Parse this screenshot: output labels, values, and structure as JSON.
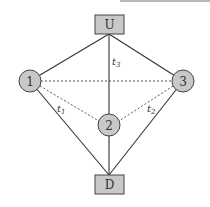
{
  "diagram": {
    "colors": {
      "node_fill": "#c8c8c8",
      "stroke": "#444444",
      "edge": "#333333",
      "background": "#ffffff"
    },
    "nodes": [
      {
        "id": "U",
        "label": "U",
        "shape": "rect",
        "x": 109,
        "y": 25
      },
      {
        "id": "1",
        "label": "1",
        "shape": "circle",
        "x": 30,
        "y": 81
      },
      {
        "id": "3",
        "label": "3",
        "shape": "circle",
        "x": 183,
        "y": 81
      },
      {
        "id": "2",
        "label": "2",
        "shape": "circle",
        "x": 109,
        "y": 125
      },
      {
        "id": "D",
        "label": "D",
        "shape": "rect",
        "x": 109,
        "y": 184
      }
    ],
    "edges": [
      {
        "from": "U",
        "to": "1",
        "style": "solid"
      },
      {
        "from": "U",
        "to": "3",
        "style": "solid"
      },
      {
        "from": "U",
        "to": "2",
        "style": "solid",
        "label": "t3"
      },
      {
        "from": "1",
        "to": "D",
        "style": "solid",
        "label": "t1"
      },
      {
        "from": "3",
        "to": "D",
        "style": "solid",
        "label": "t2"
      },
      {
        "from": "2",
        "to": "D",
        "style": "solid"
      },
      {
        "from": "1",
        "to": "3",
        "style": "dashed"
      },
      {
        "from": "1",
        "to": "2",
        "style": "dashed"
      },
      {
        "from": "3",
        "to": "2",
        "style": "dashed"
      }
    ],
    "edge_labels": {
      "t1": {
        "base": "t",
        "sub": "1"
      },
      "t2": {
        "base": "t",
        "sub": "2"
      },
      "t3": {
        "base": "t",
        "sub": "3"
      }
    }
  }
}
